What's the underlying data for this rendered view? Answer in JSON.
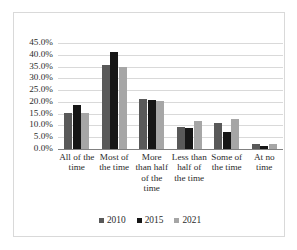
{
  "chart_data": {
    "type": "bar",
    "title": "",
    "subtitle": "",
    "xlabel": "",
    "ylabel": "",
    "grid": true,
    "legend_position": "bottom",
    "ylim": [
      0,
      45
    ],
    "ytick_step": 5,
    "ytick_labels": [
      "0.0%",
      "5.0%",
      "10.0%",
      "15.0%",
      "20.0%",
      "25.0%",
      "30.0%",
      "35.0%",
      "40.0%",
      "45.0%"
    ],
    "categories": [
      "All of the time",
      "Most of the time",
      "More than half of the time",
      "Less than half of the time",
      "Some of the time",
      "At no time"
    ],
    "series": [
      {
        "name": "2010",
        "color": "#595959",
        "values": [
          15.5,
          35.5,
          21.2,
          9.5,
          11.0,
          2.0
        ]
      },
      {
        "name": "2015",
        "color": "#161616",
        "values": [
          18.8,
          41.0,
          21.0,
          9.0,
          7.3,
          1.3
        ]
      },
      {
        "name": "2021",
        "color": "#a6a6a6",
        "values": [
          15.4,
          34.7,
          20.4,
          12.0,
          12.7,
          2.0
        ]
      }
    ]
  },
  "legend": {
    "items": [
      {
        "label": "2010"
      },
      {
        "label": "2015"
      },
      {
        "label": "2021"
      }
    ]
  }
}
